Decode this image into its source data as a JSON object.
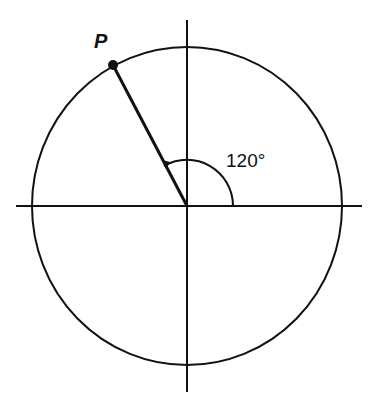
{
  "diagram": {
    "point_label": "P",
    "angle_label": "120°",
    "angle_degrees": 120,
    "colors": {
      "stroke": "#111111",
      "background": "#ffffff"
    }
  }
}
